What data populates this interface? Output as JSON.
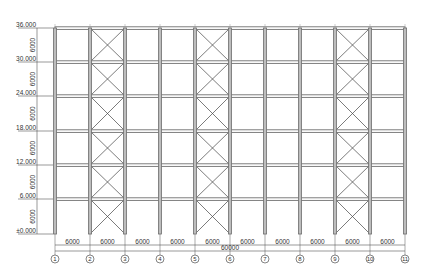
{
  "drawing": {
    "type": "steel frame elevation",
    "colors": {
      "column": "#6e6e6e",
      "beam": "#707070",
      "brace": "#444444",
      "dimension": "#555555",
      "text": "#333333",
      "background": "#ffffff"
    },
    "elevations": [
      {
        "label": "36.000",
        "y": 28
      },
      {
        "label": "30.000",
        "y": 62
      },
      {
        "label": "24.000",
        "y": 96
      },
      {
        "label": "18.000",
        "y": 131
      },
      {
        "label": "12.000",
        "y": 165
      },
      {
        "label": "6.000",
        "y": 199
      },
      {
        "label": "±0.000",
        "y": 234
      }
    ],
    "story_heights": [
      "6000",
      "6000",
      "6000",
      "6000",
      "6000",
      "6000"
    ],
    "axes": [
      {
        "label": "1",
        "x": 55
      },
      {
        "label": "2",
        "x": 90
      },
      {
        "label": "3",
        "x": 125
      },
      {
        "label": "4",
        "x": 160
      },
      {
        "label": "5",
        "x": 195
      },
      {
        "label": "6",
        "x": 230
      },
      {
        "label": "7",
        "x": 265
      },
      {
        "label": "8",
        "x": 300
      },
      {
        "label": "9",
        "x": 335
      },
      {
        "label": "10",
        "x": 370
      },
      {
        "label": "11",
        "x": 405
      }
    ],
    "bay_spans": [
      "6000",
      "6000",
      "6000",
      "6000",
      "6000",
      "6000",
      "6000",
      "6000",
      "6000",
      "6000"
    ],
    "total_span": "60000",
    "braced_bays": [
      1,
      4,
      8
    ]
  }
}
